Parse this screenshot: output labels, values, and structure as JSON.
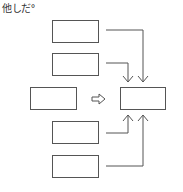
{
  "title": "他しだ°",
  "diagram": {
    "nodes": [
      {
        "id": "top-1",
        "label": ""
      },
      {
        "id": "top-2",
        "label": ""
      },
      {
        "id": "source",
        "label": ""
      },
      {
        "id": "target",
        "label": ""
      },
      {
        "id": "bottom-1",
        "label": ""
      },
      {
        "id": "bottom-2",
        "label": ""
      }
    ],
    "edges": [
      {
        "from": "top-1",
        "to": "target"
      },
      {
        "from": "top-2",
        "to": "target"
      },
      {
        "from": "source",
        "to": "target",
        "style": "hollow-arrow"
      },
      {
        "from": "bottom-1",
        "to": "target"
      },
      {
        "from": "bottom-2",
        "to": "target"
      }
    ],
    "colors": {
      "stroke": "#555555",
      "background": "#ffffff"
    }
  }
}
